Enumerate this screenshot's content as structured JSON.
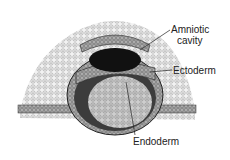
{
  "diagram": {
    "labels": {
      "amniotic_cavity": "Amniotic\ncavity",
      "amniotic_line1": "Amniotic",
      "amniotic_line2": "cavity",
      "ectoderm": "Ectoderm",
      "endoderm": "Endoderm"
    },
    "colors": {
      "ink": "#1a1a1a",
      "tissue": "#d8d8d8",
      "cavity": "#111111",
      "background": "#ffffff"
    }
  }
}
